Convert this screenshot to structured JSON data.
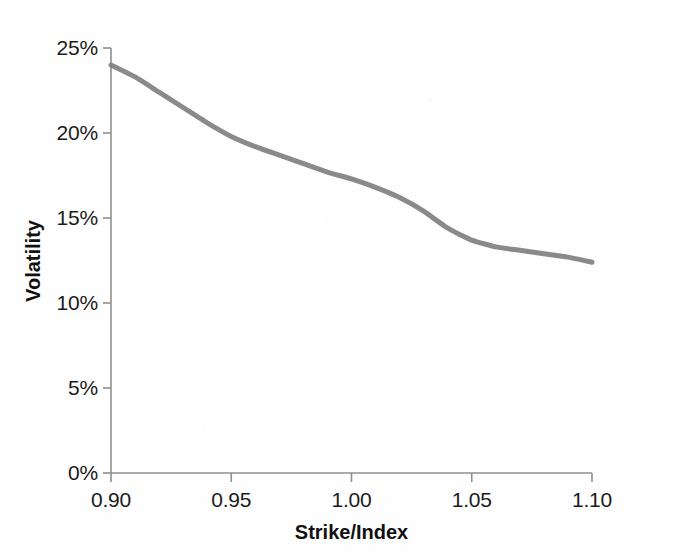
{
  "chart_data": {
    "type": "line",
    "title": "",
    "subtitle": "",
    "xlabel": "Strike/Index",
    "ylabel": "Volatility",
    "xlim": [
      0.9,
      1.1
    ],
    "ylim": [
      0.0,
      0.25
    ],
    "grid": false,
    "legend": null,
    "legend_position": "none",
    "x_tick_labels": [
      "0.90",
      "0.95",
      "1.00",
      "1.05",
      "1.10"
    ],
    "x_tick_values": [
      0.9,
      0.95,
      1.0,
      1.05,
      1.1
    ],
    "y_tick_labels": [
      "0%",
      "5%",
      "10%",
      "15%",
      "20%",
      "25%"
    ],
    "y_tick_values": [
      0,
      5,
      10,
      15,
      20,
      25
    ],
    "series": [
      {
        "name": "Implied volatility skew",
        "color": "#808080",
        "line_width": 5,
        "x": [
          0.9,
          0.91,
          0.92,
          0.93,
          0.94,
          0.95,
          0.96,
          0.97,
          0.98,
          0.99,
          1.0,
          1.01,
          1.02,
          1.03,
          1.04,
          1.05,
          1.06,
          1.07,
          1.08,
          1.09,
          1.1
        ],
        "y": [
          24.0,
          23.3,
          22.4,
          21.5,
          20.6,
          19.8,
          19.2,
          18.7,
          18.2,
          17.7,
          17.3,
          16.8,
          16.2,
          15.4,
          14.4,
          13.7,
          13.3,
          13.1,
          12.9,
          12.7,
          12.4
        ]
      }
    ],
    "annotations": []
  },
  "axes": {
    "axis_color": "#8f8f8f",
    "text_color": "#1b1b1b",
    "tick_direction": "out"
  }
}
